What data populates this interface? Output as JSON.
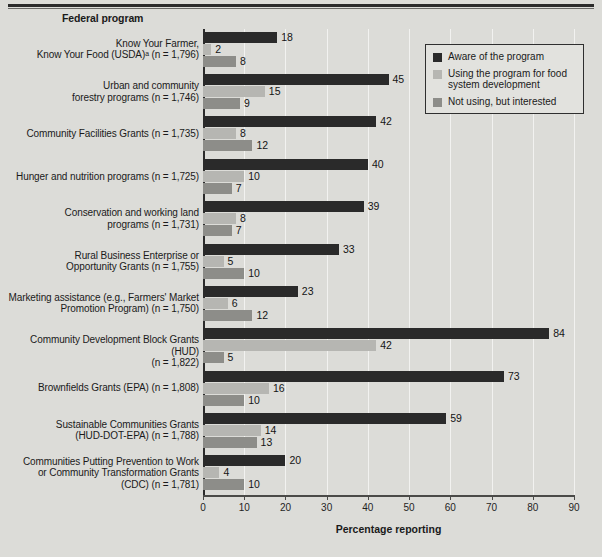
{
  "figure": {
    "column_header": "Federal program",
    "xaxis_title": "Percentage reporting"
  },
  "legend": {
    "position": "top-right",
    "items": [
      {
        "label": "Aware of the program",
        "color": "#2a2a2a"
      },
      {
        "label": "Using the program for food system development",
        "color": "#b6b6b2"
      },
      {
        "label": "Not using, but interested",
        "color": "#8d8d89"
      }
    ]
  },
  "chart_data": {
    "type": "bar",
    "orientation": "horizontal",
    "title": "",
    "subtitle": "",
    "xlabel": "Percentage reporting",
    "ylabel": "Federal program",
    "xlim": [
      0,
      90
    ],
    "xticks": [
      0,
      10,
      20,
      30,
      40,
      50,
      60,
      70,
      80,
      90
    ],
    "xticklabels": [
      "0",
      "10",
      "20",
      "30",
      "40",
      "50",
      "60",
      "70",
      "80",
      "90"
    ],
    "grid": "vertical",
    "legend_position": "top-right",
    "categories": [
      "Know Your Farmer,\nKnow Your Food (USDA)ᵃ (n = 1,796)",
      "Urban and community\nforestry programs (n = 1,746)",
      "Community Facilities Grants (n = 1,735)",
      "Hunger and nutrition programs (n = 1,725)",
      "Conservation and working land\nprograms (n = 1,731)",
      "Rural Business Enterprise or\nOpportunity Grants (n = 1,755)",
      "Marketing assistance (e.g., Farmers' Market\nPromotion Program) (n = 1,750)",
      "Community Development Block Grants (HUD)\n(n = 1,822)",
      "Brownfields Grants (EPA) (n = 1,808)",
      "Sustainable Communities Grants\n(HUD-DOT-EPA) (n = 1,788)",
      "Communities Putting Prevention to Work\nor Community Transformation Grants\n(CDC) (n = 1,781)"
    ],
    "series": [
      {
        "name": "Aware of the program",
        "color": "#2a2a2a",
        "values": [
          18,
          45,
          42,
          40,
          39,
          33,
          23,
          84,
          73,
          59,
          20
        ]
      },
      {
        "name": "Using the program for food system development",
        "color": "#b6b6b2",
        "values": [
          2,
          15,
          8,
          10,
          8,
          5,
          6,
          42,
          16,
          14,
          4
        ]
      },
      {
        "name": "Not using, but interested",
        "color": "#8d8d89",
        "values": [
          8,
          9,
          12,
          7,
          7,
          10,
          12,
          5,
          10,
          13,
          10
        ]
      }
    ]
  }
}
